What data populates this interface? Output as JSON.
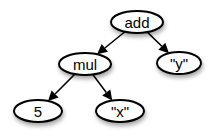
{
  "diagram": {
    "type": "expression-tree",
    "nodes": [
      {
        "id": "add",
        "label": "add",
        "cx": 137,
        "cy": 22,
        "rx": 26,
        "ry": 11
      },
      {
        "id": "mul",
        "label": "mul",
        "cx": 85,
        "cy": 64,
        "rx": 26,
        "ry": 11
      },
      {
        "id": "y",
        "label": "\"y\"",
        "cx": 179,
        "cy": 63,
        "rx": 22,
        "ry": 11
      },
      {
        "id": "five",
        "label": "5",
        "cx": 38,
        "cy": 111,
        "rx": 24,
        "ry": 11
      },
      {
        "id": "x",
        "label": "\"x\"",
        "cx": 120,
        "cy": 111,
        "rx": 24,
        "ry": 11
      }
    ],
    "edges": [
      {
        "from": "add",
        "to": "mul"
      },
      {
        "from": "add",
        "to": "y"
      },
      {
        "from": "mul",
        "to": "five"
      },
      {
        "from": "mul",
        "to": "x"
      }
    ]
  }
}
